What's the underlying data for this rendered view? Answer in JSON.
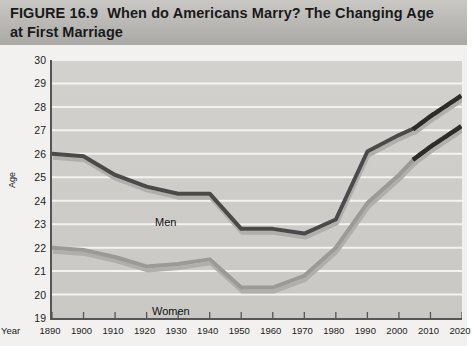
{
  "header": {
    "figure_number": "FIGURE 16.9",
    "title_line1": "When do Americans Marry? The Changing Age",
    "title_line2": "at First Marriage"
  },
  "axes": {
    "ylabel": "Age",
    "xlabel": "Year"
  },
  "labels": {
    "men": "Men",
    "women": "Women"
  },
  "chart_data": {
    "type": "line",
    "title": "When do Americans Marry? The Changing Age at First Marriage",
    "xlabel": "Year",
    "ylabel": "Age",
    "xlim": [
      1890,
      2020
    ],
    "ylim": [
      19,
      30
    ],
    "ytick_labels": [
      "30",
      "29",
      "28",
      "27",
      "26",
      "25",
      "24",
      "23",
      "22",
      "21",
      "20",
      "19"
    ],
    "xtick_labels": [
      "1890",
      "1900",
      "1910",
      "1920",
      "1930",
      "1940",
      "1950",
      "1960",
      "1970",
      "1980",
      "1990",
      "2000",
      "2010",
      "2020"
    ],
    "grid": "horizontal",
    "legend": "inline-labels",
    "series": [
      {
        "name": "Men",
        "color": "#4a4a4a",
        "x": [
          1890,
          1900,
          1910,
          1920,
          1930,
          1940,
          1950,
          1960,
          1970,
          1980,
          1990,
          2000,
          2005
        ],
        "values": [
          26.0,
          25.9,
          25.1,
          24.6,
          24.3,
          24.3,
          22.8,
          22.8,
          22.6,
          23.2,
          26.1,
          26.8,
          27.1
        ],
        "projection_x": [
          2005,
          2010,
          2020
        ],
        "projection_values": [
          27.1,
          27.6,
          28.5
        ],
        "projection_style": "dotted"
      },
      {
        "name": "Women",
        "color": "#9a9a98",
        "x": [
          1890,
          1900,
          1910,
          1920,
          1930,
          1940,
          1950,
          1960,
          1970,
          1980,
          1990,
          2000,
          2005
        ],
        "values": [
          22.0,
          21.9,
          21.6,
          21.2,
          21.3,
          21.5,
          20.3,
          20.3,
          20.8,
          22.0,
          23.9,
          25.1,
          25.8
        ],
        "projection_x": [
          2005,
          2010,
          2020
        ],
        "projection_values": [
          25.8,
          26.3,
          27.2
        ],
        "projection_style": "dotted"
      }
    ]
  }
}
